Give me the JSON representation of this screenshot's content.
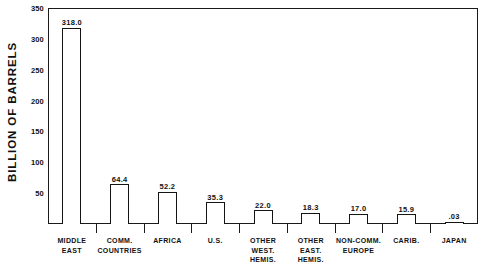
{
  "chart_data": {
    "type": "bar",
    "title": "",
    "subtitle": "",
    "xlabel": "",
    "ylabel": "BILLION OF BARRELS",
    "ylim": [
      0,
      350
    ],
    "yticks": [
      350,
      300,
      250,
      200,
      150,
      100,
      50
    ],
    "ytick_labels": [
      "350",
      "300",
      "250",
      "200",
      "150",
      "100",
      "50"
    ],
    "grid": false,
    "legend": false,
    "legend_position": "none",
    "axis_frame": "box",
    "bar_style": "unfilled-outline",
    "categories": [
      "MIDDLE EAST",
      "COMM. COUNTRIES",
      "AFRICA",
      "U.S.",
      "OTHER WEST. HEMIS.",
      "OTHER EAST. HEMIS.",
      "NON-COMM. EUROPE",
      "CARIB.",
      "JAPAN"
    ],
    "category_lines": [
      [
        "MIDDLE",
        "EAST"
      ],
      [
        "COMM.",
        "COUNTRIES"
      ],
      [
        "AFRICA"
      ],
      [
        "U.S."
      ],
      [
        "OTHER",
        "WEST.",
        "HEMIS."
      ],
      [
        "OTHER",
        "EAST.",
        "HEMIS."
      ],
      [
        "NON-COMM.",
        "EUROPE"
      ],
      [
        "CARIB."
      ],
      [
        "JAPAN"
      ]
    ],
    "values": [
      318.0,
      64.4,
      52.2,
      35.3,
      22.0,
      18.3,
      17.0,
      15.9,
      0.03
    ],
    "value_labels": [
      "318.0",
      "64.4",
      "52.2",
      "35.3",
      "22.0",
      "18.3",
      "17.0",
      "15.9",
      ".03"
    ],
    "colors": {
      "bar_fill": "#ffffff",
      "bar_stroke": "#141414",
      "axis": "#1a1a1a",
      "text": "#111111",
      "background": "#ffffff"
    }
  }
}
